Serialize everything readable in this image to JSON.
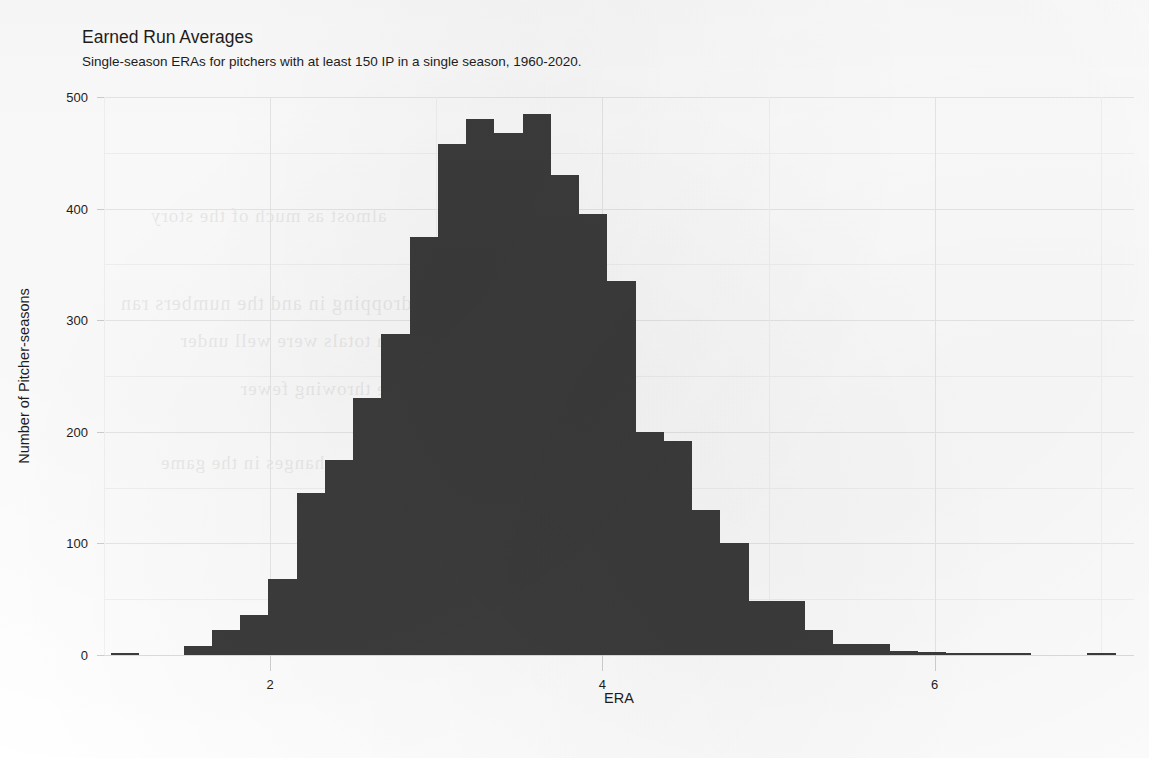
{
  "chart_data": {
    "type": "bar",
    "title": "Earned Run Averages",
    "subtitle": "Single-season ERAs for pitchers with at least 150 IP in a single season, 1960-2020.",
    "xlabel": "ERA",
    "ylabel": "Number of Pitcher-seasons",
    "xlim": [
      1.0,
      7.2
    ],
    "ylim": [
      0,
      500
    ],
    "grid": true,
    "legend_position": "none",
    "bar_color": "#3c3c3c",
    "bin_width": 0.17,
    "xticks": [
      2,
      4,
      6
    ],
    "xtick_labels": [
      "2",
      "4",
      "6"
    ],
    "yticks": [
      0,
      100,
      200,
      300,
      400,
      500
    ],
    "ytick_labels": [
      "0",
      "100",
      "200",
      "300",
      "400",
      "500"
    ],
    "yticks_minor": [
      50,
      150,
      250,
      350,
      450
    ],
    "bins": [
      {
        "left": 1.04,
        "era": 1.12,
        "count": 2
      },
      {
        "left": 1.48,
        "era": 1.56,
        "count": 8
      },
      {
        "left": 1.65,
        "era": 1.73,
        "count": 22
      },
      {
        "left": 1.82,
        "era": 1.9,
        "count": 36
      },
      {
        "left": 1.99,
        "era": 2.07,
        "count": 68
      },
      {
        "left": 2.16,
        "era": 2.24,
        "count": 145
      },
      {
        "left": 2.33,
        "era": 2.41,
        "count": 175
      },
      {
        "left": 2.5,
        "era": 2.58,
        "count": 230
      },
      {
        "left": 2.67,
        "era": 2.75,
        "count": 288
      },
      {
        "left": 2.84,
        "era": 2.92,
        "count": 375
      },
      {
        "left": 3.01,
        "era": 3.09,
        "count": 458
      },
      {
        "left": 3.18,
        "era": 3.26,
        "count": 480
      },
      {
        "left": 3.35,
        "era": 3.43,
        "count": 468
      },
      {
        "left": 3.52,
        "era": 3.6,
        "count": 485
      },
      {
        "left": 3.69,
        "era": 3.77,
        "count": 430
      },
      {
        "left": 3.86,
        "era": 3.94,
        "count": 395
      },
      {
        "left": 4.03,
        "era": 4.11,
        "count": 335
      },
      {
        "left": 4.2,
        "era": 4.28,
        "count": 200
      },
      {
        "left": 4.37,
        "era": 4.45,
        "count": 192
      },
      {
        "left": 4.54,
        "era": 4.62,
        "count": 130
      },
      {
        "left": 4.71,
        "era": 4.79,
        "count": 100
      },
      {
        "left": 4.88,
        "era": 4.96,
        "count": 48
      },
      {
        "left": 5.05,
        "era": 5.13,
        "count": 48
      },
      {
        "left": 5.22,
        "era": 5.3,
        "count": 22
      },
      {
        "left": 5.39,
        "era": 5.47,
        "count": 10
      },
      {
        "left": 5.56,
        "era": 5.64,
        "count": 10
      },
      {
        "left": 5.73,
        "era": 5.81,
        "count": 4
      },
      {
        "left": 5.9,
        "era": 5.98,
        "count": 3
      },
      {
        "left": 6.07,
        "era": 6.15,
        "count": 2
      },
      {
        "left": 6.24,
        "era": 6.32,
        "count": 2
      },
      {
        "left": 6.41,
        "era": 6.49,
        "count": 1
      },
      {
        "left": 6.92,
        "era": 7.0,
        "count": 2
      }
    ]
  },
  "bleed_text": {
    "lines": [
      "almost   as   much   of   the   story",
      "dropping   in   and   the   numbers   ran",
      "season   totals   were   well   under",
      "pitchers   were   throwing   fewer",
      "the   changes   in   the   game"
    ]
  }
}
